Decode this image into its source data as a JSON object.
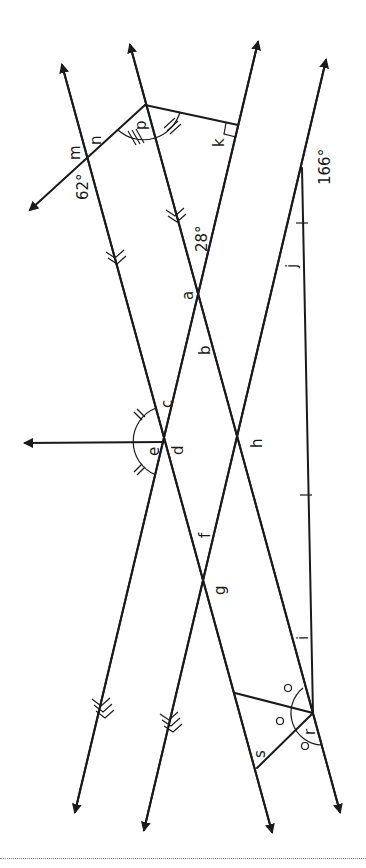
{
  "diagram": {
    "labels": {
      "m": "m",
      "n": "n",
      "p": "p",
      "k": "k",
      "a": "a",
      "b": "b",
      "c": "c",
      "d": "d",
      "e": "e",
      "f": "f",
      "g": "g",
      "h": "h",
      "i": "i",
      "j": "j",
      "r": "r",
      "s": "s"
    },
    "given_angles": {
      "angle_62": "62°",
      "angle_28": "28°",
      "angle_166": "166°"
    },
    "markings": {
      "parallel_double_arrows": "two sets of parallel lines (>> and >>>)",
      "right_angle": "at k",
      "equal_angles_triple_tick": "p split into two equal parts",
      "equal_angles_double_tick": "e split into two equal parts",
      "equal_angles_circle": "r split into three equal parts",
      "equal_angle_single_tick": "i and j"
    }
  }
}
